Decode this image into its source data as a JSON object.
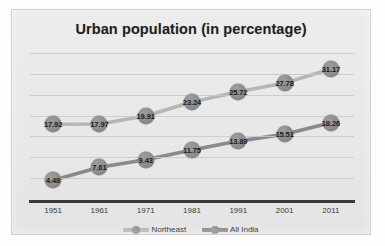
{
  "chart_data": {
    "type": "line",
    "title": "Urban population (in percentage)",
    "xlabel": "",
    "ylabel": "",
    "categories": [
      "1951",
      "1961",
      "1971",
      "1981",
      "1991",
      "2001",
      "2011"
    ],
    "ylim": [
      0,
      35
    ],
    "grid": true,
    "legend_position": "bottom",
    "series": [
      {
        "name": "Northeast",
        "color": "#b6b6b7",
        "marker_color": "#8d8d8e",
        "values": [
          17.92,
          17.97,
          19.91,
          23.24,
          25.72,
          27.78,
          31.17
        ],
        "labels": [
          "17.92",
          "17.97",
          "19.91",
          "23.24",
          "25.72",
          "27.78",
          "31.17"
        ]
      },
      {
        "name": "All India",
        "color": "#8a8a8b",
        "marker_color": "#8d8d8e",
        "values": [
          4.48,
          7.61,
          9.43,
          11.75,
          13.89,
          15.51,
          18.26
        ],
        "labels": [
          "4.48",
          "7.61",
          "9.43",
          "11.75",
          "13.89",
          "15.51",
          "18.26"
        ]
      }
    ]
  },
  "legend": {
    "items": [
      {
        "label": "Northeast"
      },
      {
        "label": "All India"
      }
    ]
  },
  "colors": {
    "panel_background": "#e9e9ea",
    "page_background": "#ffffff",
    "axis": "#3a3a3a",
    "gridline": "#c9c9ca",
    "title_text": "#1f1f1f",
    "label_text": "#1b1b1b"
  }
}
